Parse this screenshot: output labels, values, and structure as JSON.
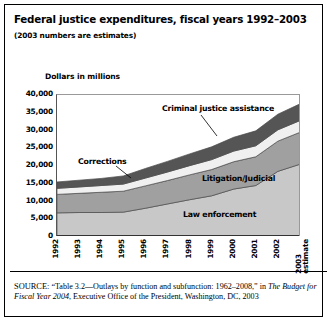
{
  "figure": {
    "title": "Federal justice expenditures, fiscal years 1992–2003",
    "subtitle": "(2003 numbers are estimates)",
    "axis_title": "Dollars in millions",
    "source_prefix": "SOURCE:",
    "source_part1": " “Table 3.2—Outlays by function and subfunction: 1962–2008,” in ",
    "source_italic": "The Budget for Fiscal Year 2004",
    "source_part2": ", Executive Office of the President, Washington, DC, 2003"
  },
  "colors": {
    "law_enforcement": "#c8c8c8",
    "litigation_judicial": "#a0a0a0",
    "corrections": "#f0f0f0",
    "criminal_justice_assistance": "#555555",
    "outline": "#4a4a4a",
    "frame": "#000000"
  },
  "series_labels": {
    "criminal_justice_assistance": "Criminal justice assistance",
    "corrections": "Corrections",
    "litigation_judicial": "Litigation/Judicial",
    "law_enforcement": "Law enforcement"
  },
  "chart_data": {
    "type": "area",
    "title": "Federal justice expenditures, fiscal years 1992–2003",
    "xlabel": "",
    "ylabel": "Dollars in millions",
    "ylim": [
      0,
      40000
    ],
    "yticks": [
      0,
      5000,
      10000,
      15000,
      20000,
      25000,
      30000,
      35000,
      40000
    ],
    "ytick_labels": [
      "0",
      "5,000",
      "10,000",
      "15,000",
      "20,000",
      "25,000",
      "30,000",
      "35,000",
      "40,000"
    ],
    "grid": false,
    "legend": "inline-annotations",
    "stacked": true,
    "categories": [
      "1992",
      "1993",
      "1994",
      "1995",
      "1996",
      "1997",
      "1998",
      "1999",
      "2000",
      "2001",
      "2002",
      "2003"
    ],
    "x_tick_labels": [
      "1992",
      "1993",
      "1994",
      "1995",
      "1996",
      "1997",
      "1998",
      "1999",
      "2000",
      "2001",
      "2002",
      "2003 estimate"
    ],
    "series": [
      {
        "name": "Law enforcement",
        "values": [
          6800,
          6900,
          6900,
          7000,
          8100,
          9300,
          10500,
          11600,
          13500,
          14500,
          18500,
          20500
        ]
      },
      {
        "name": "Litigation/Judicial",
        "values": [
          5200,
          5400,
          5700,
          5900,
          6300,
          6600,
          7000,
          7400,
          7700,
          8100,
          8500,
          9000
        ]
      },
      {
        "name": "Corrections",
        "values": [
          1700,
          1800,
          1900,
          2000,
          2200,
          2400,
          2600,
          2800,
          3000,
          3100,
          3200,
          3300
        ]
      },
      {
        "name": "Criminal justice assistance",
        "values": [
          1800,
          1900,
          2000,
          2300,
          2700,
          3000,
          3300,
          3600,
          3900,
          4200,
          4400,
          4700
        ]
      }
    ],
    "totals": [
      15500,
      16000,
      16500,
      17200,
      19300,
      21300,
      23400,
      25400,
      28100,
      29900,
      34600,
      37500
    ]
  }
}
